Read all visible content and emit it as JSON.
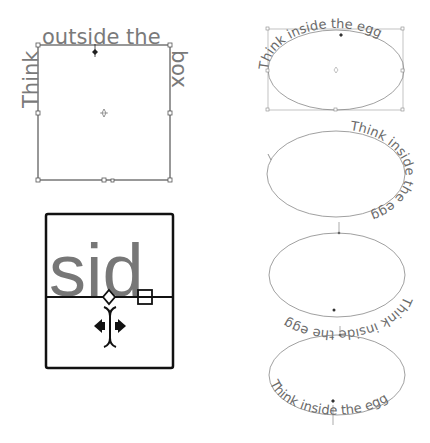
{
  "figure": {
    "panel_box": {
      "text_left": "Think",
      "text_top": "outside the",
      "text_right": "box",
      "full_text": "Think outside the box"
    },
    "panel_zoom": {
      "letters": "sid"
    },
    "panel_eggs": [
      {
        "text": "Think inside the egg",
        "position": "top"
      },
      {
        "text": "Think inside the egg",
        "position": "right"
      },
      {
        "text": "Think inside the egg",
        "position": "bottom-flipped"
      },
      {
        "text": "Think inside the egg",
        "position": "bottom"
      }
    ],
    "colors": {
      "text_gray": "#7a7a7a",
      "frame_dark": "#1a1a1a",
      "guide_gray": "#888888"
    }
  }
}
